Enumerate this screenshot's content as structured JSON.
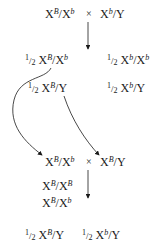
{
  "diagram": {
    "type": "genetics-cross",
    "cross1": {
      "female": {
        "allele1": "B",
        "allele2": "b",
        "second": "X"
      },
      "male": {
        "allele1": "b",
        "second": "Y"
      },
      "symbol": "×"
    },
    "f1": [
      {
        "fraction_num": "1",
        "fraction_den": "2",
        "allele1": "B",
        "allele2": "b",
        "second": "X"
      },
      {
        "fraction_num": "1",
        "fraction_den": "2",
        "allele1": "b",
        "allele2": "b",
        "second": "X"
      },
      {
        "fraction_num": "1",
        "fraction_den": "2",
        "allele1": "B",
        "second": "Y"
      },
      {
        "fraction_num": "1",
        "fraction_den": "2",
        "allele1": "b",
        "second": "Y"
      }
    ],
    "cross2": {
      "female": {
        "allele1": "B",
        "allele2": "b",
        "second": "X"
      },
      "male": {
        "allele1": "B",
        "second": "Y"
      },
      "symbol": "×"
    },
    "f2_females": [
      {
        "allele1": "B",
        "allele2": "B"
      },
      {
        "allele1": "B",
        "allele2": "b"
      }
    ],
    "f2_males": [
      {
        "fraction_num": "1",
        "fraction_den": "2",
        "allele1": "B",
        "second": "Y"
      },
      {
        "fraction_num": "1",
        "fraction_den": "2",
        "allele1": "b",
        "second": "Y"
      }
    ],
    "labels": {
      "X": "X",
      "Y": "Y",
      "slash": "/"
    },
    "colors": {
      "ink": "#1a1a1a",
      "background": "#ffffff"
    }
  }
}
